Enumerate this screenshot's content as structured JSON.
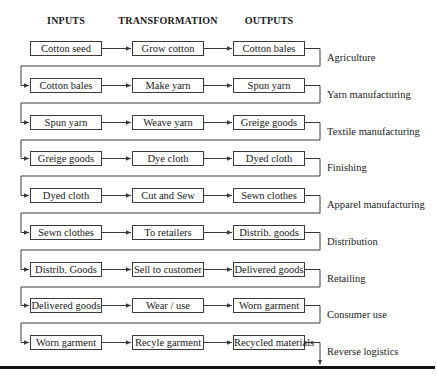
{
  "headers": {
    "inputs": "INPUTS",
    "transformation": "TRANSFORMATION",
    "outputs": "OUTPUTS"
  },
  "rows": [
    {
      "input": "Cotton seed",
      "transformation": "Grow cotton",
      "output": "Cotton bales",
      "stage": "Agriculture"
    },
    {
      "input": "Cotton bales",
      "transformation": "Make yarn",
      "output": "Spun yarn",
      "stage": "Yarn manufacturing"
    },
    {
      "input": "Spun yarn",
      "transformation": "Weave yarn",
      "output": "Greige goods",
      "stage": "Textile manufacturing"
    },
    {
      "input": "Greige goods",
      "transformation": "Dye cloth",
      "output": "Dyed cloth",
      "stage": "Finishing"
    },
    {
      "input": "Dyed cloth",
      "transformation": "Cut and Sew",
      "output": "Sewn clothes",
      "stage": "Apparel manufacturing"
    },
    {
      "input": "Sewn clothes",
      "transformation": "To retailers",
      "output": "Distrib. goods",
      "stage": "Distribution"
    },
    {
      "input": "Distrib. Goods",
      "transformation": "Sell to customer",
      "output": "Delivered goods",
      "stage": "Retailing"
    },
    {
      "input": "Delivered goods",
      "transformation": "Wear / use",
      "output": "Worn garment",
      "stage": "Consumer use"
    },
    {
      "input": "Worn garment",
      "transformation": "Recyle garment",
      "output": "Recycled materials",
      "stage": "Reverse logistics"
    }
  ],
  "colors": {
    "line": "#3a3a3a",
    "text": "#1a1a1a",
    "rule": "#111111"
  }
}
